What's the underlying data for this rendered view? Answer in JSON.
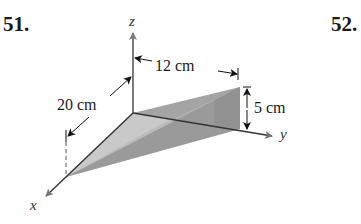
{
  "problems": [
    {
      "number": "51."
    },
    {
      "number": "52."
    }
  ],
  "figure": {
    "axes": {
      "x": "x",
      "y": "y",
      "z": "z"
    },
    "dimensions": {
      "x_length": "20 cm",
      "y_length": "12 cm",
      "height": "5 cm"
    },
    "colors": {
      "axis": "#2b2b2b",
      "axis_arrow": "#666666",
      "face_light": "#c8c8c8",
      "face_mid": "#a9a9a9",
      "face_dark": "#8f8f8f",
      "face_back": "#9c9c9c"
    }
  }
}
